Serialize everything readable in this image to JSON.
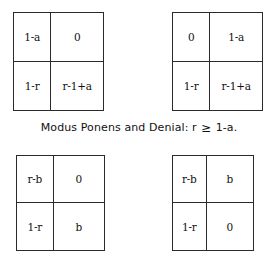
{
  "figure": {
    "caption": {
      "prefix": "Modus Ponens and Denial:",
      "variable": "r",
      "relation": "≥",
      "bound": "1-a."
    },
    "matrices": [
      {
        "name": "matrix-top-left",
        "position": "top-left",
        "cells": [
          [
            "1-a",
            "0"
          ],
          [
            "1-r",
            "r-1+a"
          ]
        ]
      },
      {
        "name": "matrix-top-right",
        "position": "top-right",
        "cells": [
          [
            "0",
            "1-a"
          ],
          [
            "1-r",
            "r-1+a"
          ]
        ]
      },
      {
        "name": "matrix-bottom-left",
        "position": "bottom-left",
        "cells": [
          [
            "r-b",
            "0"
          ],
          [
            "1-r",
            "b"
          ]
        ]
      },
      {
        "name": "matrix-bottom-right",
        "position": "bottom-right",
        "cells": [
          [
            "r-b",
            "b"
          ],
          [
            "1-r",
            "0"
          ]
        ]
      }
    ]
  },
  "colors": {
    "background": "#ffffff",
    "border": "#2a2a2a",
    "text": "#111111"
  }
}
